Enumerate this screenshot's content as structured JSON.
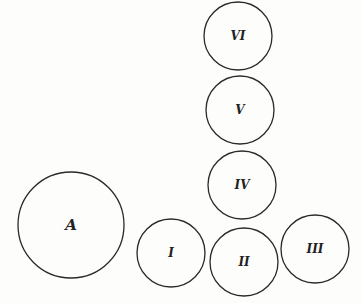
{
  "diagram": {
    "colors": {
      "stroke": "#2a2a2a",
      "label": "#222222",
      "background": "#fdfdfc"
    },
    "circles": [
      {
        "id": "A",
        "label": "A",
        "cx": 71,
        "cy": 225,
        "r": 53,
        "font_size": 15
      },
      {
        "id": "I",
        "label": "I",
        "cx": 171,
        "cy": 253,
        "r": 34,
        "font_size": 12
      },
      {
        "id": "II",
        "label": "II",
        "cx": 244,
        "cy": 262,
        "r": 34,
        "font_size": 12
      },
      {
        "id": "III",
        "label": "III",
        "cx": 315,
        "cy": 249,
        "r": 34,
        "font_size": 12
      },
      {
        "id": "IV",
        "label": "IV",
        "cx": 242,
        "cy": 185,
        "r": 34,
        "font_size": 12
      },
      {
        "id": "V",
        "label": "V",
        "cx": 240,
        "cy": 110,
        "r": 34,
        "font_size": 12
      },
      {
        "id": "VI",
        "label": "VI",
        "cx": 238,
        "cy": 36,
        "r": 34,
        "font_size": 12
      }
    ]
  }
}
